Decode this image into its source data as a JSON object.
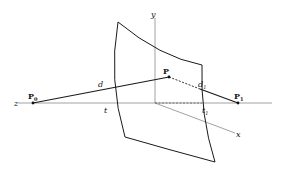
{
  "diagram": {
    "type": "ray-surface-intersection",
    "colors": {
      "axis": "#8a8a8a",
      "line": "#1a1a1a",
      "surface": "#1a1a1a"
    },
    "axes": {
      "y": "y",
      "z": "z",
      "x": "x"
    },
    "points": {
      "p0": {
        "label": "P",
        "sub": "0"
      },
      "p": {
        "label": "P"
      },
      "p1": {
        "label": "P",
        "sub": "1"
      }
    },
    "distances": {
      "d": "d",
      "d1": {
        "label": "d",
        "sub": "1"
      }
    },
    "params": {
      "t": "t",
      "t1": {
        "label": "t",
        "sub": "1"
      }
    }
  }
}
